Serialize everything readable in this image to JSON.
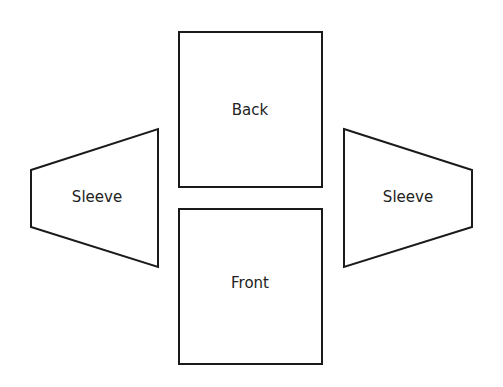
{
  "diagram": {
    "pieces": [
      {
        "id": "back",
        "label": "Back",
        "shape": "rectangle"
      },
      {
        "id": "front",
        "label": "Front",
        "shape": "rectangle"
      },
      {
        "id": "left-sleeve",
        "label": "Sleeve",
        "shape": "trapezoid"
      },
      {
        "id": "right-sleeve",
        "label": "Sleeve",
        "shape": "trapezoid"
      }
    ],
    "colors": {
      "stroke": "#1a1a1a",
      "fill": "#ffffff",
      "text": "#222222"
    }
  }
}
